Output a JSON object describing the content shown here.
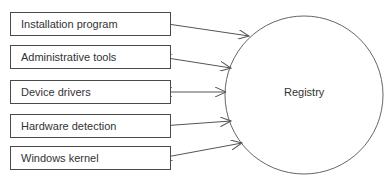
{
  "diagram": {
    "components": [
      {
        "label": "Installation program",
        "direction": "to-registry"
      },
      {
        "label": "Administrative tools",
        "direction": "bidirectional"
      },
      {
        "label": "Device drivers",
        "direction": "bidirectional"
      },
      {
        "label": "Hardware detection",
        "direction": "to-registry"
      },
      {
        "label": "Windows kernel",
        "direction": "bidirectional"
      }
    ],
    "center": {
      "label": "Registry"
    }
  }
}
